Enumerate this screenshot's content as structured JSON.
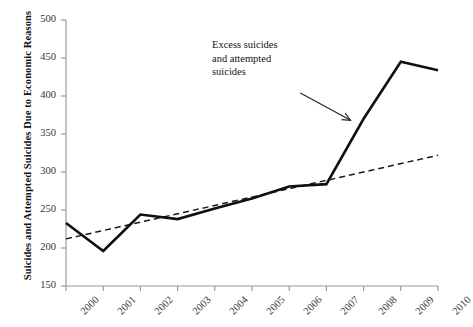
{
  "chart_data": {
    "type": "line",
    "title": "",
    "xlabel": "",
    "ylabel": "Suicides and Attempted Suicides Due to Economic Reasons",
    "categories": [
      "2000",
      "2001",
      "2002",
      "2003",
      "2004",
      "2005",
      "2006",
      "2007",
      "2008",
      "2009",
      "2010"
    ],
    "x": [
      2000,
      2001,
      2002,
      2003,
      2004,
      2005,
      2006,
      2007,
      2008,
      2009,
      2010
    ],
    "xlim": [
      2000,
      2010
    ],
    "ylim": [
      150,
      500
    ],
    "yticks": [
      150,
      200,
      250,
      300,
      350,
      400,
      450,
      500
    ],
    "grid": false,
    "legend": "none",
    "series": [
      {
        "name": "Actual suicides and attempted suicides",
        "style": "solid",
        "values": [
          233,
          196,
          244,
          238,
          252,
          265,
          281,
          284,
          370,
          445,
          434
        ]
      },
      {
        "name": "Pre-crisis trend",
        "style": "dashed",
        "x": [
          2000,
          2010
        ],
        "values": [
          212,
          322
        ]
      }
    ],
    "annotations": [
      {
        "text": "Excess suicides and attempted suicides",
        "lines": [
          "Excess suicides",
          "and attempted",
          "suicides"
        ],
        "arrow_from": [
          2006.3,
          404
        ],
        "arrow_to": [
          2007.65,
          368
        ]
      }
    ]
  },
  "axis": {
    "ytick_labels": [
      "500",
      "450",
      "400",
      "350",
      "300",
      "250",
      "200",
      "150"
    ],
    "xtick_labels": [
      "2000",
      "2001",
      "2002",
      "2003",
      "2004",
      "2005",
      "2006",
      "2007",
      "2008",
      "2009",
      "2010"
    ],
    "y_title": "Suicides and Attempted Suicides Due to Economic Reasons"
  },
  "annotation": {
    "line1": "Excess suicides",
    "line2": "and attempted",
    "line3": "suicides"
  },
  "colors": {
    "series_solid": "#101010",
    "series_dashed": "#1a1a1a",
    "axis": "#9a9a9a",
    "text": "#2a2a2a",
    "background": "#ffffff"
  }
}
